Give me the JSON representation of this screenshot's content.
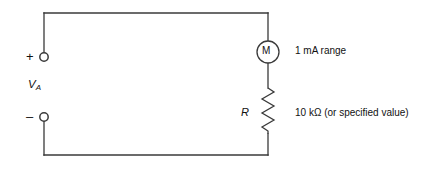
{
  "figure": {
    "type": "circuit-schematic",
    "background_color": "#ffffff",
    "line_color": "#3a3a3a"
  },
  "source": {
    "name": "V",
    "name_subscript": "A",
    "plus_terminal_label": "+",
    "minus_terminal_label": "–"
  },
  "meter": {
    "symbol": "M",
    "range_label": "1 mA range"
  },
  "resistor": {
    "designator": "R",
    "value_label": "10 kΩ (or specified value)"
  }
}
